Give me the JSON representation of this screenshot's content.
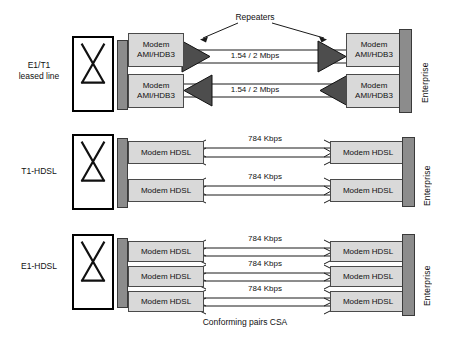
{
  "diagram": {
    "caption": "Conforming pairs CSA",
    "repeaters_label": "Repeaters",
    "enterprise_label": "Enterprise",
    "colors": {
      "modem_fill": "#d9d9d9",
      "bar_fill": "#8c8c8c",
      "repeater_fill": "#4d4d4d",
      "line": "#1a1a1a",
      "background": "#ffffff"
    },
    "sections": [
      {
        "id": "e1t1-leased-line",
        "label": "E1/T1\nleased line",
        "has_repeaters": true,
        "links": [
          {
            "rate": "1.54 / 2 Mbps",
            "direction": "right",
            "left_modem": {
              "line1": "Modem",
              "line2": "AMI/HDB3"
            },
            "right_modem": {
              "line1": "Modem",
              "line2": "AMI/HDB3"
            }
          },
          {
            "rate": "1.54 / 2 Mbps",
            "direction": "left",
            "left_modem": {
              "line1": "Modem",
              "line2": "AMI/HDB3"
            },
            "right_modem": {
              "line1": "Modem",
              "line2": "AMI/HDB3"
            }
          }
        ]
      },
      {
        "id": "t1-hdsl",
        "label": "T1-HDSL",
        "has_repeaters": false,
        "links": [
          {
            "rate": "784 Kbps",
            "direction": "bidirectional",
            "left_modem": {
              "line1": "Modem HDSL",
              "line2": ""
            },
            "right_modem": {
              "line1": "Modem HDSL",
              "line2": ""
            }
          },
          {
            "rate": "784 Kbps",
            "direction": "bidirectional",
            "left_modem": {
              "line1": "Modem HDSL",
              "line2": ""
            },
            "right_modem": {
              "line1": "Modem HDSL",
              "line2": ""
            }
          }
        ]
      },
      {
        "id": "e1-hdsl",
        "label": "E1-HDSL",
        "has_repeaters": false,
        "links": [
          {
            "rate": "784 Kbps",
            "direction": "bidirectional",
            "left_modem": {
              "line1": "Modem HDSL",
              "line2": ""
            },
            "right_modem": {
              "line1": "Modem HDSL",
              "line2": ""
            }
          },
          {
            "rate": "784 Kbps",
            "direction": "bidirectional",
            "left_modem": {
              "line1": "Modem HDSL",
              "line2": ""
            },
            "right_modem": {
              "line1": "Modem HDSL",
              "line2": ""
            }
          },
          {
            "rate": "784 Kbps",
            "direction": "bidirectional",
            "left_modem": {
              "line1": "Modem HDSL",
              "line2": ""
            },
            "right_modem": {
              "line1": "Modem HDSL",
              "line2": ""
            }
          }
        ]
      }
    ]
  }
}
